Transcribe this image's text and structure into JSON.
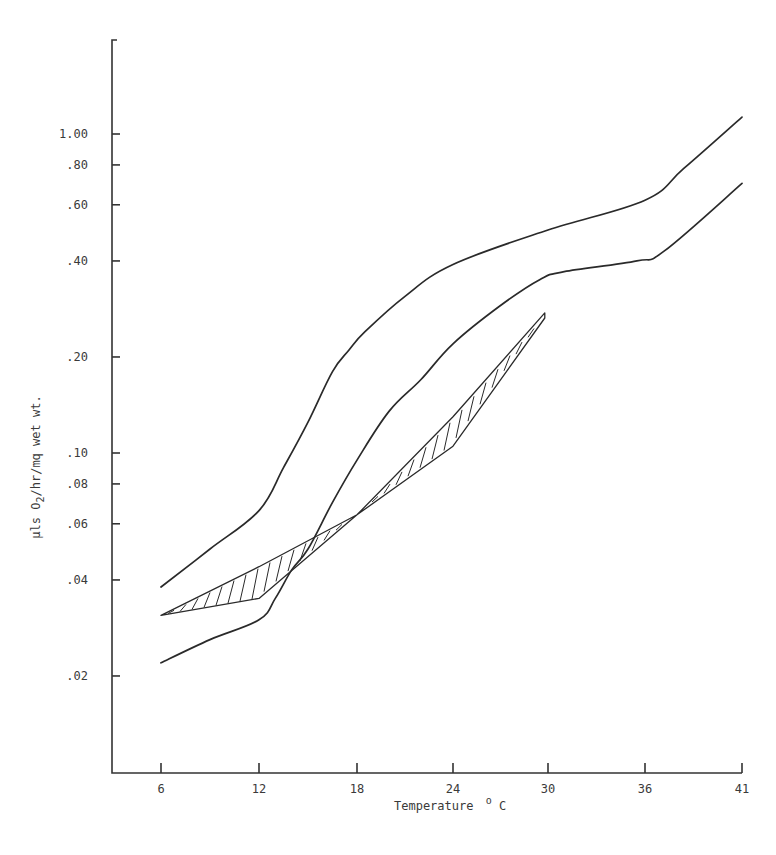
{
  "chart_data": {
    "type": "line",
    "title": "",
    "xlabel": "Temperature",
    "xlabel_unit": "°C",
    "xlabel_unit_sup": "o",
    "xlabel_unit_base": "C",
    "ylabel": "µls O2/hr/mg wet wt.",
    "ylabel_parts": {
      "pre": "µls O",
      "sub": "2",
      "post": "/hr/mq wet wt."
    },
    "yscale": "log",
    "x_ticks": [
      6,
      12,
      18,
      24,
      30,
      36,
      41
    ],
    "y_ticks": [
      {
        "value": 1.0,
        "label": "1.00"
      },
      {
        "value": 0.8,
        "label": ".80"
      },
      {
        "value": 0.6,
        "label": ".60"
      },
      {
        "value": 0.4,
        "label": ".40"
      },
      {
        "value": 0.2,
        "label": ".20"
      },
      {
        "value": 0.1,
        "label": ".10"
      },
      {
        "value": 0.08,
        "label": ".08"
      },
      {
        "value": 0.06,
        "label": ".06"
      },
      {
        "value": 0.04,
        "label": ".04"
      },
      {
        "value": 0.02,
        "label": ".02"
      }
    ],
    "grid": false,
    "legend": null,
    "series": [
      {
        "name": "upper curve",
        "style": "solid",
        "x": [
          6,
          9,
          12,
          13.5,
          15,
          16.5,
          17.5,
          18.5,
          21,
          24,
          30,
          36,
          38,
          41
        ],
        "values": [
          0.038,
          0.05,
          0.066,
          0.09,
          0.125,
          0.18,
          0.21,
          0.24,
          0.31,
          0.39,
          0.5,
          0.62,
          0.78,
          1.13
        ]
      },
      {
        "name": "lower curve",
        "style": "solid",
        "x": [
          6,
          9,
          12,
          13,
          14,
          15,
          16.5,
          18,
          20,
          22,
          24,
          27,
          29.5,
          31,
          35.5,
          37,
          41
        ],
        "values": [
          0.022,
          0.026,
          0.03,
          0.035,
          0.043,
          0.05,
          0.07,
          0.095,
          0.135,
          0.17,
          0.22,
          0.29,
          0.35,
          0.37,
          0.4,
          0.43,
          0.7
        ]
      },
      {
        "name": "hatched band (upper edge)",
        "style": "hatched",
        "x": [
          6,
          12,
          18,
          24,
          29.8
        ],
        "values": [
          0.031,
          0.044,
          0.064,
          0.13,
          0.275
        ]
      },
      {
        "name": "hatched band (lower edge)",
        "style": "hatched",
        "x": [
          6,
          12,
          18,
          24,
          29.8
        ],
        "values": [
          0.031,
          0.035,
          0.064,
          0.105,
          0.265
        ]
      }
    ],
    "xlim": [
      3,
      41
    ],
    "ylim": [
      0.01,
      2.0
    ]
  }
}
